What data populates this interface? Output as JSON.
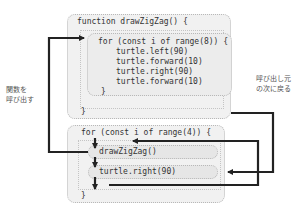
{
  "function_block": {
    "header": "function drawZigZag() {",
    "closing": "}",
    "loop": {
      "header": "for (const i of range(8)) {",
      "body": [
        "turtle.left(90)",
        "turtle.forward(10)",
        "turtle.right(90)",
        "turtle.forward(10)"
      ],
      "closing": "}"
    }
  },
  "main_loop": {
    "header": "for (const i of range(4)) {",
    "statements": [
      "drawZigZag()",
      "turtle.right(90)"
    ],
    "closing": "}"
  },
  "annotations": {
    "call_function": [
      "関数を",
      "呼び出す"
    ],
    "return_to_caller": [
      "呼び出し元",
      "の次に戻る"
    ]
  },
  "colors": {
    "arrow": "#222222",
    "box_fill": "#f1f1f1",
    "box_border": "#b8b8b8"
  }
}
